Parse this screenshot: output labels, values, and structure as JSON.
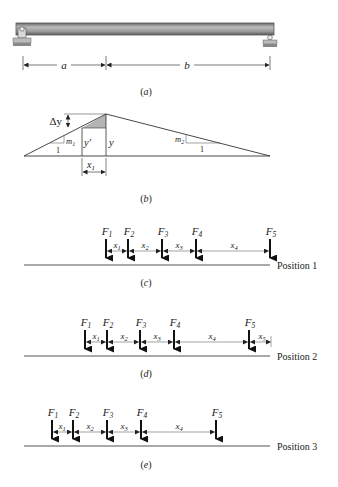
{
  "figure_a": {
    "caption": "(a)",
    "dim_a": "a",
    "dim_b": "b"
  },
  "figure_b": {
    "caption": "(b)",
    "delta_y": "Δy",
    "y_prime": "y′",
    "y": "y",
    "m1": "m",
    "m1_sub": "1",
    "m2": "m",
    "m2_sub": "2",
    "run1": "1",
    "run2": "1",
    "x1": "x",
    "x1_sub": "1"
  },
  "figure_c": {
    "caption": "(c)",
    "position_label": "Position 1",
    "forces": [
      "F1",
      "F2",
      "F3",
      "F4",
      "F5"
    ],
    "spacings": [
      "x1",
      "x2",
      "x3",
      "x4"
    ]
  },
  "figure_d": {
    "caption": "(d)",
    "position_label": "Position 2",
    "forces": [
      "F1",
      "F2",
      "F3",
      "F4",
      "F5"
    ],
    "spacings": [
      "x1",
      "x2",
      "x3",
      "x4",
      "x5"
    ]
  },
  "figure_e": {
    "caption": "(e)",
    "position_label": "Position 3",
    "forces": [
      "F1",
      "F2",
      "F3",
      "F4",
      "F5"
    ],
    "spacings": [
      "x1",
      "x2",
      "x3",
      "x4"
    ]
  },
  "labels": {
    "F": "F",
    "x": "x",
    "s1": "1",
    "s2": "2",
    "s3": "3",
    "s4": "4",
    "s5": "5"
  }
}
